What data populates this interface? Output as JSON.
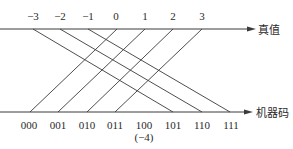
{
  "diagram": {
    "top_axis": {
      "label": "真值",
      "ticks": [
        "−3",
        "−2",
        "−1",
        "0",
        "1",
        "2",
        "3"
      ]
    },
    "bottom_axis": {
      "label": "机器码",
      "ticks": [
        "000",
        "001",
        "010",
        "011",
        "100",
        "101",
        "110",
        "111"
      ],
      "annotation": "(−4)"
    },
    "mappings": [
      {
        "from": "0",
        "to": "000"
      },
      {
        "from": "1",
        "to": "001"
      },
      {
        "from": "2",
        "to": "010"
      },
      {
        "from": "3",
        "to": "011"
      },
      {
        "from": "−4",
        "to": "100"
      },
      {
        "from": "−3",
        "to": "101"
      },
      {
        "from": "−2",
        "to": "110"
      },
      {
        "from": "−1",
        "to": "111"
      }
    ],
    "colors": {
      "line": "#3a3a3a",
      "text": "#2a2a2a",
      "background": "#ffffff"
    }
  }
}
